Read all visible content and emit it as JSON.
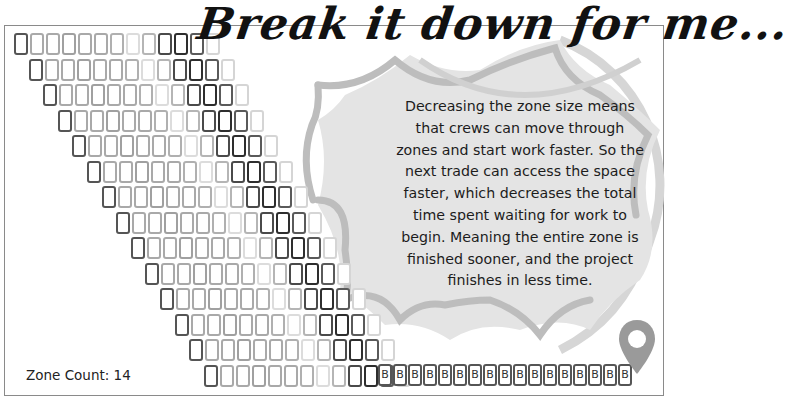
{
  "title": "Break it down for me...",
  "explanation": "Decreasing the zone size means that crews can move through zones and start work faster. So the next trade can access the space faster, which decreases the total time spent waiting for work to begin. Meaning the entire zone is finished sooner, and the project finishes in less time.",
  "explanation_lines": [
    "Decreasing the zone size means",
    "that crews can move through",
    "zones and start work faster. So the",
    "next trade can access the space",
    "faster, which decreases the total",
    "time spent waiting for work to",
    "begin. Meaning the entire zone is",
    "finished sooner, and the project",
    "finishes in less time."
  ],
  "zone_count_label": "Zone Count: 14",
  "zone_count": 14,
  "grid": {
    "rows": 14,
    "cells_per_row": 13,
    "shade_pattern": [
      "#555555",
      "#a9a9a9",
      "#a9a9a9",
      "#a0a0a0",
      "#a9a9a9",
      "#a9a9a9",
      "#b0b0b0",
      "#dcdcdc",
      "#b5b5b5",
      "#4a4a4a",
      "#2e2e2e",
      "#5a5a5a",
      "#d5d5d5"
    ]
  },
  "b_row": {
    "label": "B",
    "count": 17
  },
  "icons": {
    "pin": "map-pin-icon",
    "burst": "starburst-shape"
  },
  "colors": {
    "burst_fill": "#e4e4e4",
    "burst_stroke": "#bdbdbd",
    "pin": "#9a9a9a",
    "frame": "#8a8a8a"
  }
}
